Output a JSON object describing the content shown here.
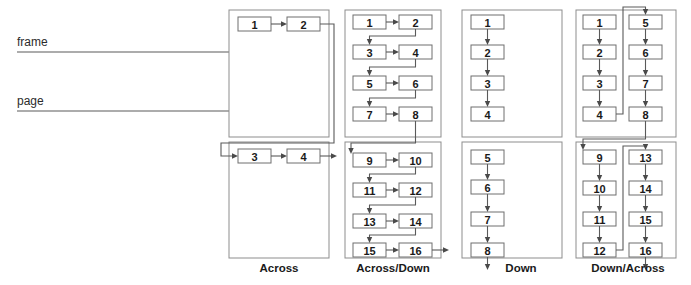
{
  "figure": {
    "kind": "progression-order-diagram",
    "background_color": "#ffffff",
    "line_color": "#5a5a5a",
    "box_border_color": "#6e6e6e",
    "panel_border_color": "#8d8d8d",
    "text_color": "#1a1a1a"
  },
  "leaders": [
    {
      "label": "frame",
      "id": "frame-leader"
    },
    {
      "label": "page",
      "id": "page-leader"
    }
  ],
  "columns": [
    {
      "id": "across",
      "label": "Across",
      "panels": [
        {
          "id": "across-page-1",
          "cells": [
            "1",
            "2"
          ]
        },
        {
          "id": "across-page-2",
          "cells": [
            "3",
            "4"
          ]
        }
      ]
    },
    {
      "id": "across-down",
      "label": "Across/Down",
      "panels": [
        {
          "id": "across-down-page-1",
          "cells": [
            "1",
            "2",
            "3",
            "4",
            "5",
            "6",
            "7",
            "8"
          ]
        },
        {
          "id": "across-down-page-2",
          "cells": [
            "9",
            "10",
            "11",
            "12",
            "13",
            "14",
            "15",
            "16"
          ]
        }
      ]
    },
    {
      "id": "down",
      "label": "Down",
      "panels": [
        {
          "id": "down-page-1",
          "cells": [
            "1",
            "2",
            "3",
            "4"
          ]
        },
        {
          "id": "down-page-2",
          "cells": [
            "5",
            "6",
            "7",
            "8"
          ]
        }
      ]
    },
    {
      "id": "down-across",
      "label": "Down/Across",
      "panels": [
        {
          "id": "down-across-page-1",
          "cells": [
            "1",
            "2",
            "3",
            "4",
            "5",
            "6",
            "7",
            "8"
          ]
        },
        {
          "id": "down-across-page-2",
          "cells": [
            "9",
            "10",
            "11",
            "12",
            "13",
            "14",
            "15",
            "16"
          ]
        }
      ]
    }
  ],
  "cells": {
    "a_1": "1",
    "a_2": "2",
    "a_3": "3",
    "a_4": "4",
    "ad_1": "1",
    "ad_2": "2",
    "ad_3": "3",
    "ad_4": "4",
    "ad_5": "5",
    "ad_6": "6",
    "ad_7": "7",
    "ad_8": "8",
    "ad_9": "9",
    "ad_10": "10",
    "ad_11": "11",
    "ad_12": "12",
    "ad_13": "13",
    "ad_14": "14",
    "ad_15": "15",
    "ad_16": "16",
    "d_1": "1",
    "d_2": "2",
    "d_3": "3",
    "d_4": "4",
    "d_5": "5",
    "d_6": "6",
    "d_7": "7",
    "d_8": "8",
    "da_1": "1",
    "da_2": "2",
    "da_3": "3",
    "da_4": "4",
    "da_5": "5",
    "da_6": "6",
    "da_7": "7",
    "da_8": "8",
    "da_9": "9",
    "da_10": "10",
    "da_11": "11",
    "da_12": "12",
    "da_13": "13",
    "da_14": "14",
    "da_15": "15",
    "da_16": "16"
  },
  "labels": {
    "across": "Across",
    "across_down": "Across/Down",
    "down": "Down",
    "down_across": "Down/Across",
    "frame": "frame",
    "page": "page"
  }
}
